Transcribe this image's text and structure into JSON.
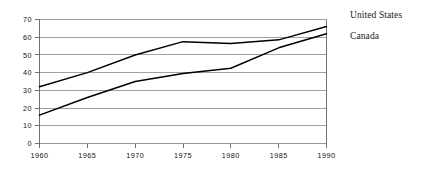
{
  "chart_data": {
    "type": "line",
    "title": "",
    "xlabel": "",
    "ylabel": "",
    "x": [
      1960,
      1965,
      1970,
      1975,
      1980,
      1985,
      1990
    ],
    "xtick_labels": [
      "1960",
      "1965",
      "1970",
      "1975",
      "1980",
      "1985",
      "1990"
    ],
    "ytick_labels": [
      "0",
      "10",
      "20",
      "30",
      "40",
      "50",
      "60",
      "70"
    ],
    "yticks": [
      0,
      10,
      20,
      30,
      40,
      50,
      60,
      70
    ],
    "xlim": [
      1960,
      1990
    ],
    "ylim": [
      0,
      70
    ],
    "grid": "horizontal",
    "legend_position": "right-outside",
    "series": [
      {
        "name": "United States",
        "color": "#000000",
        "values": [
          32,
          40,
          50,
          57.5,
          56.5,
          58.5,
          66
        ]
      },
      {
        "name": "Canada",
        "color": "#000000",
        "values": [
          16,
          26,
          35,
          39.5,
          42.5,
          54,
          62
        ]
      }
    ]
  },
  "legend": {
    "entries": [
      {
        "label": "United States"
      },
      {
        "label": "Canada"
      }
    ]
  },
  "colors": {
    "background": "#ffffff",
    "gridline": "#8a8a8a",
    "axis": "#6f6f6f",
    "line": "#000000",
    "text": "#111111"
  }
}
